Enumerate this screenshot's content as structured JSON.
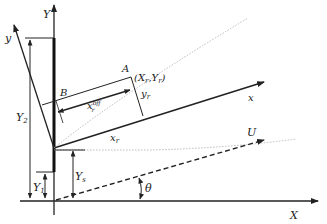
{
  "diagram": {
    "type": "coordinate-geometry",
    "labels": {
      "Y_axis": "Y",
      "X_axis": "X",
      "y_axis": "y",
      "x_axis": "x",
      "U": "U",
      "A": "A",
      "A_coords": "(X",
      "A_coords_sub1": "r",
      "A_coords_mid": ",Y",
      "A_coords_sub2": "r",
      "A_coords_end": ")",
      "B": "B",
      "x_off_main": "x",
      "x_off_sup": "off",
      "x_off_sub": "r",
      "y_r_main": "y",
      "y_r_sub": "r",
      "x_r_main": "x",
      "x_r_sub": "r",
      "Y1_main": "Y",
      "Y1_sub": "1",
      "Y2_main": "Y",
      "Y2_sub": "2",
      "Ys_main": "Y",
      "Ys_sub": "s",
      "theta": "θ"
    },
    "colors": {
      "line": "#222222",
      "dotted": "#bbbbbb"
    }
  }
}
